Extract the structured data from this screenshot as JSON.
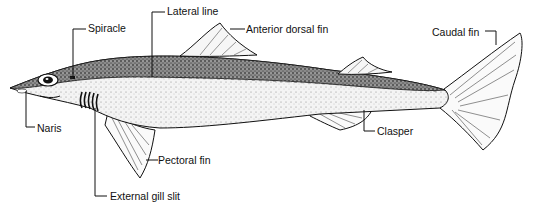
{
  "diagram": {
    "colors": {
      "ink": "#111111",
      "background": "#ffffff",
      "dorsal_shade": "#6e6e6e",
      "ventral_shade": "#e6e6e6"
    },
    "labels": [
      {
        "id": "lateral-line",
        "text": "Lateral line"
      },
      {
        "id": "spiracle",
        "text": "Spiracle"
      },
      {
        "id": "anterior-dorsal-fin",
        "text": "Anterior dorsal fin"
      },
      {
        "id": "caudal-fin",
        "text": "Caudal fin"
      },
      {
        "id": "naris",
        "text": "Naris"
      },
      {
        "id": "pectoral-fin",
        "text": "Pectoral fin"
      },
      {
        "id": "clasper",
        "text": "Clasper"
      },
      {
        "id": "external-gill-slit",
        "text": "External gill slit"
      }
    ]
  }
}
